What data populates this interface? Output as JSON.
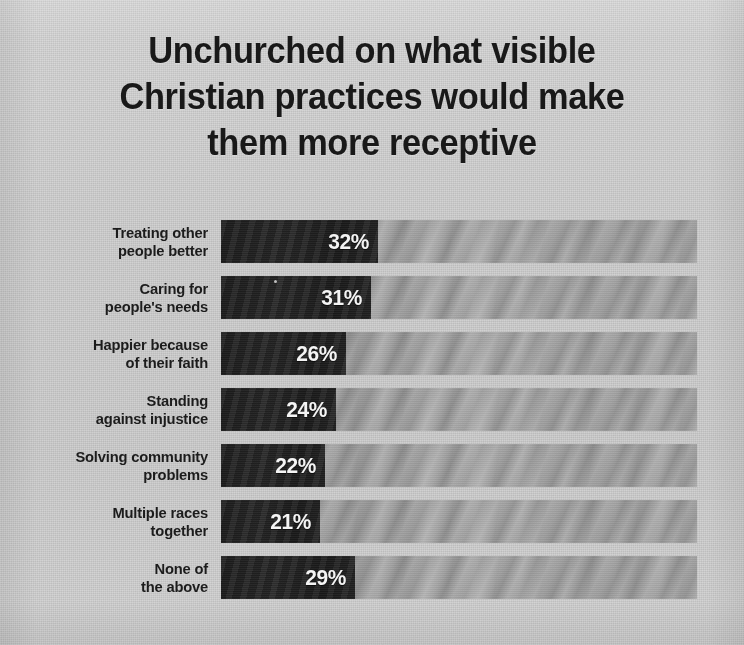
{
  "title": {
    "lines": [
      "Unchurched on what visible",
      "Christian practices would make",
      "them more receptive"
    ]
  },
  "colors": {
    "background": "#d2d2d2",
    "bar": "#212121",
    "track": "#a3a3a3",
    "title_text": "#191919",
    "label_text": "#1c1c1c",
    "value_text": "#f4f4f4"
  },
  "chart_data": {
    "type": "bar",
    "orientation": "horizontal",
    "title": "Unchurched on what visible Christian practices would make them more receptive",
    "xlabel": "",
    "ylabel": "",
    "xlim": [
      0,
      100
    ],
    "grid": false,
    "legend": null,
    "value_suffix": "%",
    "categories": [
      "Treating other people better",
      "Caring for people's needs",
      "Happier because of their faith",
      "Standing against injustice",
      "Solving community problems",
      "Multiple races together",
      "None of the above"
    ],
    "values": [
      32,
      31,
      26,
      24,
      22,
      21,
      29
    ],
    "value_labels": [
      "32%",
      "31%",
      "26%",
      "24%",
      "22%",
      "21%",
      "29%"
    ]
  },
  "rows": [
    {
      "label_lines": [
        "Treating other",
        "people better"
      ],
      "value": 32,
      "value_label": "32%",
      "bar_width_px": 157
    },
    {
      "label_lines": [
        "Caring for",
        "people's needs"
      ],
      "value": 31,
      "value_label": "31%",
      "bar_width_px": 150
    },
    {
      "label_lines": [
        "Happier because",
        "of their faith"
      ],
      "value": 26,
      "value_label": "26%",
      "bar_width_px": 125
    },
    {
      "label_lines": [
        "Standing",
        "against injustice"
      ],
      "value": 24,
      "value_label": "24%",
      "bar_width_px": 115
    },
    {
      "label_lines": [
        "Solving community",
        "problems"
      ],
      "value": 22,
      "value_label": "22%",
      "bar_width_px": 104
    },
    {
      "label_lines": [
        "Multiple races",
        "together"
      ],
      "value": 21,
      "value_label": "21%",
      "bar_width_px": 99
    },
    {
      "label_lines": [
        "None of",
        "the above"
      ],
      "value": 29,
      "value_label": "29%",
      "bar_width_px": 134
    }
  ]
}
